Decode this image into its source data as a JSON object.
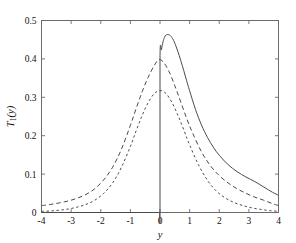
{
  "chart_data": {
    "type": "line",
    "title": "",
    "subtitle": "",
    "xlabel": "y",
    "ylabel": "T1(y)",
    "ylabel_base": "T",
    "ylabel_subscript": "1",
    "ylabel_arg": "(y)",
    "xlim": [
      -4,
      4
    ],
    "ylim": [
      0,
      0.5
    ],
    "xticks": [
      -4,
      -3,
      -2,
      -1,
      0,
      1,
      2,
      3,
      4
    ],
    "xtick_labels": [
      "-4",
      "-3",
      "-2",
      "-1",
      "0",
      "1",
      "2",
      "3",
      "4"
    ],
    "yticks": [
      0,
      0.1,
      0.2,
      0.3,
      0.4,
      0.5
    ],
    "ytick_labels": [
      "0",
      "0.1",
      "0.2",
      "0.3",
      "0.4",
      "0.5"
    ],
    "grid": false,
    "legend": "none",
    "axis_color": "#6b6b6b",
    "curve_color": "#4a4a4a",
    "background": "#ffffff",
    "annotations": [
      "solid curve is discontinuous at y = 0, jumping from 0 to about 0.40",
      "solid curve peak about 0.463 near y = 0.3",
      "long-dashed curve peak about 0.398 near y = -0.05",
      "short-dashed curve peak about 0.318 near y = 0.0"
    ],
    "series": [
      {
        "name": "solid",
        "style": "solid",
        "peak_x": 0.3,
        "peak_y": 0.463,
        "x": [
          -4.0,
          -3.6,
          -3.2,
          -2.8,
          -2.4,
          -2.0,
          -1.6,
          -1.2,
          -0.8,
          -0.4,
          -0.1,
          -0.02,
          0.0,
          0.0,
          0.05,
          0.1,
          0.15,
          0.2,
          0.25,
          0.3,
          0.35,
          0.4,
          0.45,
          0.5,
          0.6,
          0.7,
          0.8,
          0.9,
          1.0,
          1.2,
          1.4,
          1.6,
          1.8,
          2.0,
          2.3,
          2.6,
          2.9,
          3.2,
          3.5,
          3.8,
          4.0
        ],
        "y": [
          0.0,
          0.0,
          0.0,
          0.0,
          0.0,
          0.0,
          0.0,
          0.0,
          0.0,
          0.0,
          0.0,
          0.0,
          0.0,
          0.399,
          0.424,
          0.444,
          0.456,
          0.462,
          0.4635,
          0.463,
          0.4605,
          0.456,
          0.4495,
          0.441,
          0.42,
          0.396,
          0.37,
          0.343,
          0.317,
          0.268,
          0.228,
          0.196,
          0.17,
          0.149,
          0.1245,
          0.1065,
          0.0925,
          0.0805,
          0.0665,
          0.0525,
          0.045
        ]
      },
      {
        "name": "dashed-long",
        "style": "dashed",
        "peak_x": -0.05,
        "peak_y": 0.398,
        "x": [
          -4.0,
          -3.7,
          -3.4,
          -3.1,
          -2.8,
          -2.5,
          -2.2,
          -1.9,
          -1.6,
          -1.3,
          -1.0,
          -0.8,
          -0.6,
          -0.4,
          -0.2,
          -0.05,
          0.1,
          0.3,
          0.5,
          0.7,
          0.9,
          1.1,
          1.4,
          1.7,
          2.0,
          2.3,
          2.6,
          2.9,
          3.2,
          3.5,
          3.8,
          4.0
        ],
        "y": [
          0.018,
          0.021,
          0.025,
          0.03,
          0.037,
          0.047,
          0.062,
          0.085,
          0.118,
          0.165,
          0.227,
          0.272,
          0.315,
          0.352,
          0.382,
          0.3975,
          0.393,
          0.368,
          0.33,
          0.288,
          0.245,
          0.207,
          0.158,
          0.122,
          0.096,
          0.077,
          0.062,
          0.05,
          0.04,
          0.032,
          0.023,
          0.018
        ]
      },
      {
        "name": "dashed-short",
        "style": "dotted",
        "peak_x": 0.0,
        "peak_y": 0.318,
        "x": [
          -4.0,
          -3.7,
          -3.4,
          -3.1,
          -2.8,
          -2.5,
          -2.2,
          -1.9,
          -1.6,
          -1.3,
          -1.0,
          -0.8,
          -0.6,
          -0.4,
          -0.2,
          0.0,
          0.2,
          0.4,
          0.6,
          0.8,
          1.0,
          1.3,
          1.6,
          1.9,
          2.2,
          2.5,
          2.8,
          3.1,
          3.4,
          3.7,
          4.0
        ],
        "y": [
          0.003,
          0.004,
          0.006,
          0.009,
          0.014,
          0.021,
          0.032,
          0.05,
          0.077,
          0.118,
          0.172,
          0.214,
          0.253,
          0.286,
          0.309,
          0.3175,
          0.31,
          0.287,
          0.254,
          0.216,
          0.176,
          0.124,
          0.084,
          0.056,
          0.038,
          0.026,
          0.018,
          0.012,
          0.008,
          0.005,
          0.003
        ]
      }
    ]
  }
}
